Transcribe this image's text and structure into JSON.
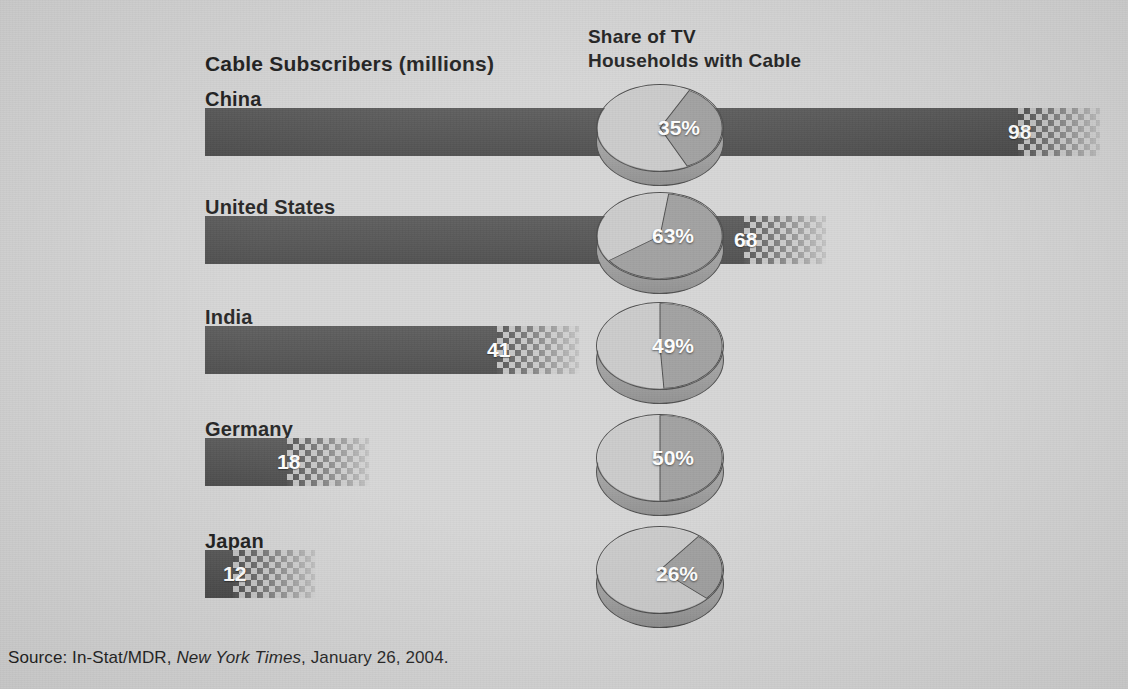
{
  "headers": {
    "subscribers": "Cable Subscribers (millions)",
    "share_line1": "Share of TV",
    "share_line2": "Households with Cable"
  },
  "source": {
    "prefix": "Source: In-Stat/MDR, ",
    "publication": "New York Times",
    "suffix": ", January 26, 2004."
  },
  "colors": {
    "background": "#d2d2d2",
    "bar": "#4a4a4a",
    "pie_light": "#c6c6c6",
    "pie_dark": "#989898",
    "text_dark": "#111111",
    "text_light": "#ffffff"
  },
  "chart_data": {
    "type": "bar",
    "title": "Cable Subscribers (millions)",
    "xlabel": "",
    "ylabel": "",
    "categories": [
      "China",
      "United States",
      "India",
      "Germany",
      "Japan"
    ],
    "series": [
      {
        "name": "Cable Subscribers (millions)",
        "values": [
          98,
          68,
          41,
          18,
          12
        ]
      },
      {
        "name": "Share of TV Households with Cable (%)",
        "values": [
          35,
          63,
          49,
          50,
          26
        ]
      }
    ],
    "value_labels": [
      "98",
      "68",
      "41",
      "18",
      "12"
    ],
    "share_labels": [
      "35%",
      "63%",
      "49%",
      "50%",
      "26%"
    ],
    "xlim": [
      0,
      98
    ],
    "grid": false,
    "legend": "none",
    "secondary_chart_type": "pie",
    "rows": [
      {
        "country": "China",
        "subscribers": 98,
        "subscribers_label": "98",
        "share": 35,
        "share_label": "35%"
      },
      {
        "country": "United States",
        "subscribers": 68,
        "subscribers_label": "68",
        "share": 63,
        "share_label": "63%"
      },
      {
        "country": "India",
        "subscribers": 41,
        "subscribers_label": "41",
        "share": 49,
        "share_label": "49%"
      },
      {
        "country": "Germany",
        "subscribers": 18,
        "subscribers_label": "18",
        "share": 50,
        "share_label": "50%"
      },
      {
        "country": "Japan",
        "subscribers": 12,
        "subscribers_label": "12",
        "share": 26,
        "share_label": "26%"
      }
    ]
  }
}
